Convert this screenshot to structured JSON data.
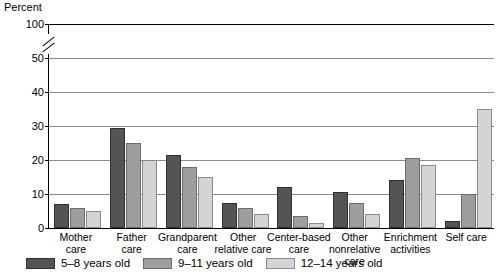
{
  "chart_data": {
    "type": "bar",
    "title": "",
    "xlabel": "",
    "ylabel": "Percent",
    "ylim": [
      0,
      100
    ],
    "yticks": [
      0,
      10,
      20,
      30,
      40,
      50,
      100
    ],
    "axis_break": true,
    "axis_break_between": [
      50,
      100
    ],
    "grid": "horizontal",
    "legend_position": "bottom-left",
    "categories": [
      "Mother care",
      "Father care",
      "Grandparent care",
      "Other relative care",
      "Center-based care",
      "Other nonrelative care",
      "Enrichment activities",
      "Self care"
    ],
    "category_lines": [
      [
        "Mother",
        "care"
      ],
      [
        "Father",
        "care"
      ],
      [
        "Grandparent",
        "care"
      ],
      [
        "Other",
        "relative care"
      ],
      [
        "Center-based",
        "care"
      ],
      [
        "Other",
        "nonrelative care"
      ],
      [
        "Enrichment",
        "activities"
      ],
      [
        "Self care",
        ""
      ]
    ],
    "series": [
      {
        "name": "5–8 years old",
        "color": "#545454",
        "values": [
          7,
          29.5,
          21.5,
          7.5,
          12,
          10.5,
          14,
          2
        ]
      },
      {
        "name": "9–11 years old",
        "color": "#9e9e9e",
        "values": [
          6,
          25,
          18,
          6,
          3.5,
          7.5,
          20.5,
          10
        ]
      },
      {
        "name": "12–14 years old",
        "color": "#d4d4d4",
        "values": [
          5,
          20,
          15,
          4,
          1.5,
          4,
          18.5,
          35
        ]
      }
    ]
  },
  "axis": {
    "y_title": "Percent"
  }
}
